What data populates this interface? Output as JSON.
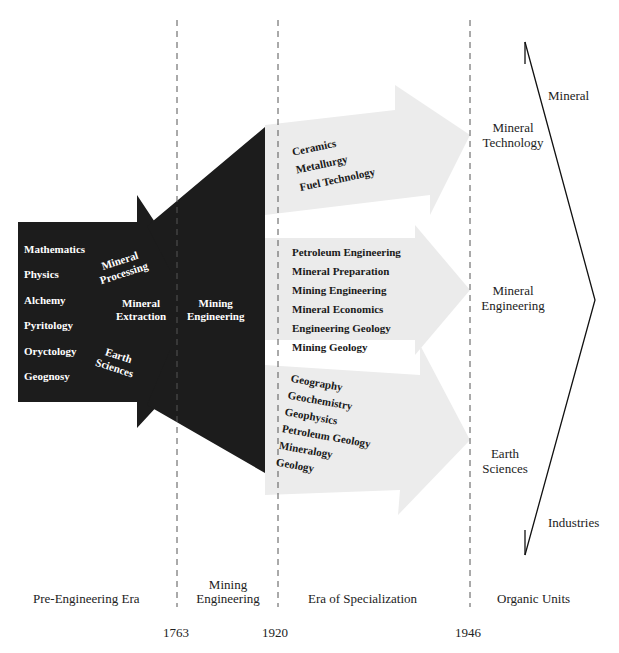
{
  "diagram": {
    "colors": {
      "dark_fill": "#1c1c1c",
      "light_arrow_fill": "#ececec",
      "dashed_line": "#555555",
      "bracket_line": "#111111",
      "background": "#ffffff"
    },
    "pre_engineering_block": {
      "subjects": [
        "Mathematics",
        "Physics",
        "Alchemy",
        "Pyritology",
        "Oryctology",
        "Geognosy"
      ],
      "arrow_labels": {
        "mineral_processing": [
          "Mineral",
          "Processing"
        ],
        "mineral_extraction": [
          "Mineral",
          "Extraction"
        ],
        "earth_sciences": [
          "Earth",
          "Sciences"
        ]
      }
    },
    "mining_engineering_block": {
      "label": [
        "Mining",
        "Engineering"
      ]
    },
    "specialization_arrows": [
      {
        "id": "mineral-technology",
        "items": [
          "Ceramics",
          "Metallurgy",
          "Fuel Technology"
        ],
        "outcome": [
          "Mineral",
          "Technology"
        ]
      },
      {
        "id": "mineral-engineering",
        "items": [
          "Petroleum Engineering",
          "Mineral Preparation",
          "Mining Engineering",
          "Mineral Economics",
          "Engineering Geology",
          "Mining Geology"
        ],
        "outcome": [
          "Mineral",
          "Engineering"
        ]
      },
      {
        "id": "earth-sciences",
        "items": [
          "Geography",
          "Geochemistry",
          "Geophysics",
          "Petroleum Geology",
          "Mineralogy",
          "Geology"
        ],
        "outcome": [
          "Earth",
          "Sciences"
        ]
      }
    ],
    "bracket": {
      "top_label": "Mineral",
      "bottom_label": "Industries"
    },
    "eras": [
      {
        "label": "Pre-Engineering Era"
      },
      {
        "label": "Mining Engineering"
      },
      {
        "label": "Era of Specialization"
      },
      {
        "label": "Organic Units"
      }
    ],
    "years": [
      "1763",
      "1920",
      "1946"
    ]
  }
}
